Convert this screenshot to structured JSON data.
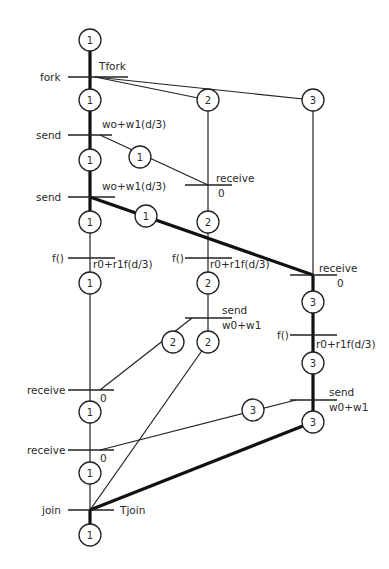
{
  "diagram": {
    "events": {
      "fork": "fork",
      "tfork": "Tfork",
      "send1": "send",
      "send1_cost": "wo+w1(d/3)",
      "send2": "send",
      "send2_cost": "wo+w1(d/3)",
      "receive_c2": "receive",
      "receive_c2_cost": "0",
      "f1": "f()",
      "f1_cost": "r0+r1f(d/3)",
      "f2": "f()",
      "f2_cost": "r0+r1f(d/3)",
      "receive_c3": "receive",
      "receive_c3_cost": "0",
      "send_c2": "send",
      "send_c2_cost": "w0+w1",
      "f3": "f()",
      "f3_cost": "r0+r1f(d/3)",
      "send_c3": "send",
      "send_c3_cost": "w0+w1",
      "receive_c1a": "receive",
      "receive_c1a_cost": "0",
      "receive_c1b": "receive",
      "receive_c1b_cost": "0",
      "join": "join",
      "tjoin": "Tjoin"
    },
    "nodes": {
      "n_start": "1",
      "n_c1_a": "1",
      "n_c2_a": "2",
      "n_c3_a": "3",
      "n_c1_b": "1",
      "n_msg1": "1",
      "n_c1_c": "1",
      "n_msg2": "1",
      "n_c2_b": "2",
      "n_c1_d": "1",
      "n_c2_c": "2",
      "n_c3_b": "3",
      "n_msg3": "2",
      "n_c2_d": "2",
      "n_c3_c": "3",
      "n_c1_e": "1",
      "n_msg4": "3",
      "n_c3_d": "3",
      "n_c1_f": "1",
      "n_end": "1"
    }
  }
}
